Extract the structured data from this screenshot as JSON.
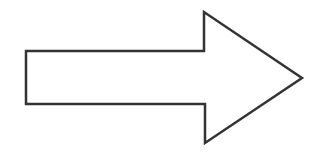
{
  "diagram": {
    "shape": "block-arrow",
    "direction": "right",
    "fill": "#ffffff",
    "stroke": "#333333",
    "stroke_width": 2.5,
    "points": "26,51 204,51 204,12 302,78 205,143 205,104 26,104"
  }
}
